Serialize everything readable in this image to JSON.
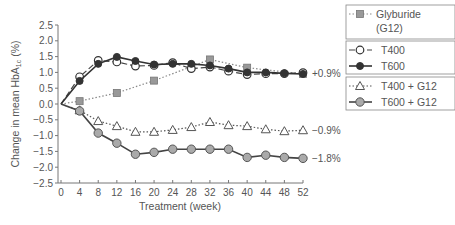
{
  "chart_data": {
    "type": "line",
    "title": "",
    "xlabel": "Treatment (week)",
    "ylabel": "Change in mean HbA1c (%)",
    "ylabel_main": "Change in mean HbA",
    "ylabel_sub": "1c",
    "ylabel_suffix": " (%)",
    "xlim": [
      0,
      52
    ],
    "ylim": [
      -2.5,
      2.5
    ],
    "xticks": [
      0,
      4,
      8,
      12,
      16,
      20,
      24,
      28,
      32,
      36,
      40,
      44,
      48,
      52
    ],
    "yticks": [
      2.5,
      2.0,
      1.5,
      1.0,
      0.5,
      0.0,
      -0.5,
      -1.0,
      -1.5,
      -2.0,
      -2.5
    ],
    "ytick_labels": [
      "2.5",
      "2.0",
      "1.5",
      "1.0",
      "0.5",
      "0.0",
      "−0.5",
      "−1.0",
      "−1.5",
      "−2.0",
      "−2.5"
    ],
    "grid": false,
    "legend_position": "right",
    "series": [
      {
        "name": "Glyburide (G12)",
        "legend_lines": [
          "Glyburide",
          "(G12)"
        ],
        "marker": "square",
        "line": "dotted",
        "color": "#8a8a8a",
        "x": [
          0,
          4,
          12,
          20,
          28,
          32,
          40,
          52
        ],
        "values": [
          0.0,
          0.09,
          0.35,
          0.74,
          1.18,
          1.41,
          1.15,
          0.95
        ]
      },
      {
        "name": "T400",
        "legend_lines": [
          "T400"
        ],
        "marker": "open-circle",
        "line": "dashed",
        "color": "#444444",
        "x": [
          0,
          4,
          8,
          12,
          16,
          20,
          24,
          28,
          32,
          36,
          40,
          44,
          48,
          52
        ],
        "values": [
          0.0,
          0.86,
          1.38,
          1.33,
          1.2,
          1.22,
          1.31,
          1.12,
          1.17,
          1.04,
          0.93,
          0.96,
          0.96,
          0.99
        ]
      },
      {
        "name": "T600",
        "legend_lines": [
          "T600"
        ],
        "marker": "filled-circle",
        "line": "solid",
        "color": "#333333",
        "x": [
          0,
          4,
          8,
          12,
          16,
          20,
          24,
          28,
          32,
          36,
          40,
          44,
          48,
          52
        ],
        "values": [
          0.0,
          0.73,
          1.27,
          1.49,
          1.36,
          1.25,
          1.27,
          1.27,
          1.22,
          1.12,
          1.0,
          1.0,
          0.97,
          0.95
        ]
      },
      {
        "name": "T400 + G12",
        "legend_lines": [
          "T400 + G12"
        ],
        "marker": "open-triangle",
        "line": "dotted",
        "color": "#555555",
        "x": [
          0,
          4,
          8,
          12,
          16,
          20,
          24,
          28,
          32,
          36,
          40,
          44,
          48,
          52
        ],
        "values": [
          0.0,
          -0.2,
          -0.54,
          -0.7,
          -0.88,
          -0.88,
          -0.82,
          -0.73,
          -0.57,
          -0.67,
          -0.7,
          -0.8,
          -0.86,
          -0.83
        ]
      },
      {
        "name": "T600 + G12",
        "legend_lines": [
          "T600 + G12"
        ],
        "marker": "gray-circle",
        "line": "solid",
        "color": "#444444",
        "x": [
          0,
          4,
          8,
          12,
          16,
          20,
          24,
          28,
          32,
          36,
          40,
          44,
          48,
          52
        ],
        "values": [
          0.0,
          -0.22,
          -0.92,
          -1.24,
          -1.59,
          -1.53,
          -1.43,
          -1.43,
          -1.43,
          -1.43,
          -1.69,
          -1.62,
          -1.69,
          -1.72
        ]
      }
    ],
    "annotations": [
      {
        "text": "+0.9%",
        "x": 52,
        "y": 0.97
      },
      {
        "text": "−0.9%",
        "x": 52,
        "y": -0.83
      },
      {
        "text": "−1.8%",
        "x": 52,
        "y": -1.72
      }
    ],
    "legend_groups": [
      [
        0
      ],
      [
        1,
        2
      ],
      [
        3,
        4
      ]
    ]
  }
}
